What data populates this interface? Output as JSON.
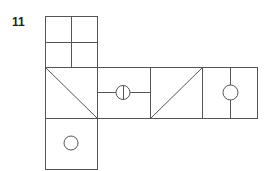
{
  "figure": {
    "number": "11",
    "stroke_color": "#555555",
    "faces": [
      {
        "id": "top",
        "pattern": "quadrants"
      },
      {
        "id": "row-1",
        "pattern": "diagonal-down"
      },
      {
        "id": "row-2",
        "pattern": "horizontal-line-circle-vertical-split"
      },
      {
        "id": "row-3",
        "pattern": "diagonal-up"
      },
      {
        "id": "row-4",
        "pattern": "vertical-line-circle"
      },
      {
        "id": "bottom",
        "pattern": "circle"
      }
    ]
  }
}
